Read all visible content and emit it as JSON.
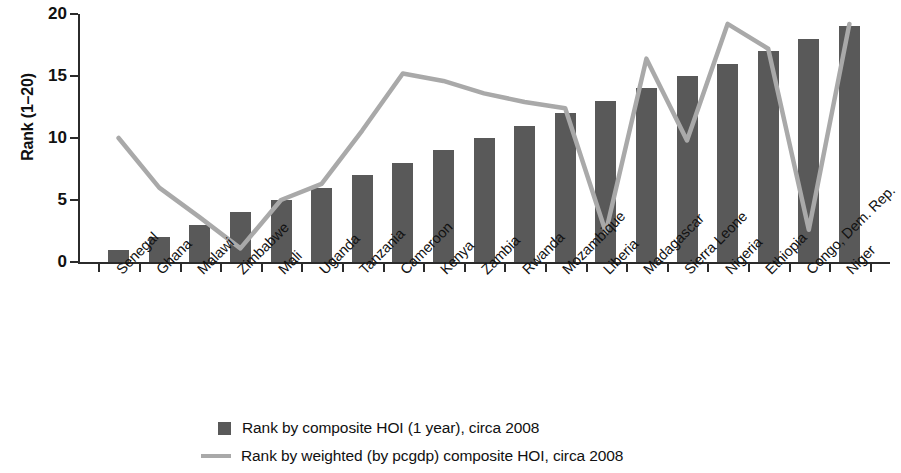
{
  "chart_data": {
    "type": "bar",
    "title": "",
    "xlabel": "",
    "ylabel": "Rank (1–20)",
    "ylim": [
      0,
      20
    ],
    "yticks": [
      0,
      5,
      10,
      15,
      20
    ],
    "grid": false,
    "legend_position": "bottom",
    "categories": [
      "Senegal",
      "Ghana",
      "Malawi",
      "Zimbabwe",
      "Mali",
      "Uganda",
      "Tanzania",
      "Cameroon",
      "Kenya",
      "Zambia",
      "Rwanda",
      "Mozambique",
      "Liberia",
      "Madagascar",
      "Sierra Leone",
      "Nigeria",
      "Ethiopia",
      "Congo, Dem. Rep.",
      "Niger"
    ],
    "series": [
      {
        "name": "Rank by composite HOI (1 year), circa 2008",
        "type": "bar",
        "color": "#595959",
        "values": [
          1,
          2,
          3,
          4,
          5,
          6,
          7,
          8,
          9,
          10,
          11,
          12,
          13,
          14,
          15,
          16,
          17,
          18,
          19
        ]
      },
      {
        "name": "Rank by weighted (by pcgdp) composite HOI, circa 2008",
        "type": "line",
        "color": "#a9a9a9",
        "values": [
          10,
          6,
          3.6,
          1.1,
          5,
          6.3,
          10.6,
          15.2,
          14.6,
          13.6,
          12.9,
          12.4,
          2.4,
          16.4,
          9.8,
          19.2,
          17.2,
          2.6,
          19.2
        ]
      }
    ]
  },
  "axis": {
    "y_title": "Rank (1–20)",
    "y_tick_labels": [
      "0",
      "5",
      "10",
      "15",
      "20"
    ]
  },
  "legend": {
    "items": [
      {
        "marker": "square-swatch",
        "label": "Rank by composite HOI (1 year), circa 2008"
      },
      {
        "marker": "line-swatch",
        "label": "Rank by weighted (by pcgdp) composite HOI, circa 2008"
      }
    ]
  }
}
